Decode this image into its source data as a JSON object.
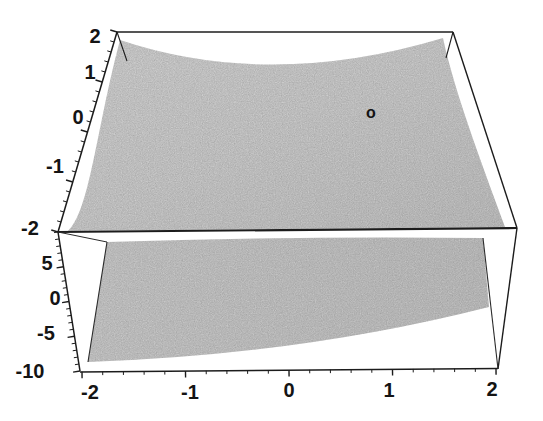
{
  "figure": {
    "background": "#ffffff",
    "marker_label": "o",
    "axes": {
      "x": {
        "labels": [
          "-2",
          "-1",
          "0",
          "1",
          "2"
        ]
      },
      "y": {
        "labels": [
          "2",
          "1",
          "0",
          "-1",
          "-2"
        ]
      },
      "z": {
        "labels": [
          "5",
          "0",
          "-5",
          "-10"
        ]
      }
    },
    "colors": {
      "line": "#1c1c1c",
      "upper_surface": "#cdcdcd",
      "lower_surface": "#c6c6c6",
      "background": "#ffffff"
    }
  },
  "chart_data": {
    "type": "3d-surface",
    "title": "",
    "xlabel": "",
    "ylabel": "",
    "zlabel": "",
    "axes": {
      "x": {
        "range": [
          -2,
          2
        ],
        "tick_values": [
          -2,
          -1,
          0,
          1,
          2
        ],
        "minor_ticks_per_interval": 4
      },
      "y": {
        "range": [
          -2,
          2
        ],
        "tick_values": [
          2,
          1,
          0,
          -1,
          -2
        ],
        "minor_ticks_per_interval": 4
      },
      "z": {
        "visible_tick_values": [
          5,
          0,
          -5,
          -10
        ],
        "range_estimate": [
          -10,
          10
        ],
        "minor_ticks_per_interval": 4
      }
    },
    "grid": false,
    "legend": null,
    "elements": [
      {
        "kind": "surface",
        "name": "upper-surface",
        "shade": "light-gray stippled",
        "description": "bowl-like surface over x,y in [-2,2]; corners rise to the top box corners, interior sags toward the middle, front edge lies along the z=top front box edge"
      },
      {
        "kind": "surface",
        "name": "lower-plane",
        "shade": "gray stippled",
        "description": "tilted plane below, lowest at the front-left bottom corner (z near -10), rising toward the right side of the box"
      },
      {
        "kind": "point-marker",
        "symbol": "o",
        "description": "small open circle marker printed on the upper surface, right of center near y≈0"
      }
    ]
  }
}
